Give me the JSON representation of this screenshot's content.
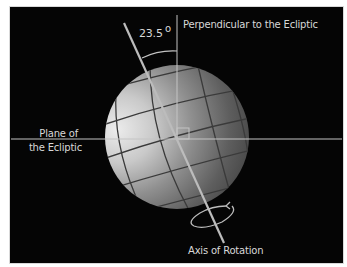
{
  "diagram": {
    "type": "earth-axial-tilt",
    "labels": {
      "perpendicular": "Perpendicular to the Ecliptic",
      "angle_value": "23.5",
      "angle_unit": "o",
      "plane_line1": "Plane of",
      "plane_line2": "the Ecliptic",
      "axis": "Axis of Rotation"
    },
    "tilt_degrees": 23.5,
    "colors": {
      "background": "#050505",
      "lines": "#c8c8c8",
      "sphere_highlight": "#e0e0e0",
      "sphere_mid": "#8c8c8c",
      "sphere_shadow": "#4a4a4a",
      "grid": "#3a3a3a",
      "text": "#d8d8d8"
    }
  }
}
